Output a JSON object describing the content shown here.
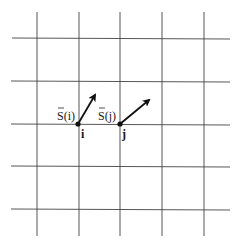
{
  "diagram": {
    "type": "lattice-spin-diagram",
    "grid": {
      "vertical_x": [
        37,
        79,
        120,
        162,
        204
      ],
      "horizontal_y": [
        38,
        81,
        124,
        166,
        209
      ],
      "line_color": "#444444"
    },
    "sites": [
      {
        "id": "i",
        "label": "i",
        "spin_label": "S(i)",
        "x": 78,
        "y": 124,
        "arrow_tip": [
          96,
          93
        ]
      },
      {
        "id": "j",
        "label": "j",
        "spin_label": "S(j)",
        "x": 120,
        "y": 124,
        "arrow_tip": [
          151,
          99
        ]
      }
    ]
  }
}
